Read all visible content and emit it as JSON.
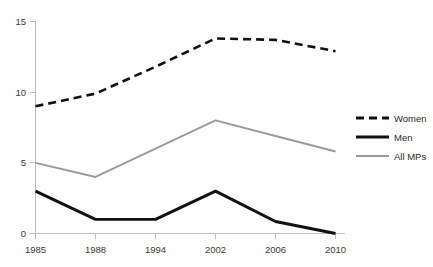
{
  "chart_data": {
    "type": "line",
    "title": "",
    "subtitle": "",
    "xlabel": "",
    "ylabel": "",
    "categories": [
      "1985",
      "1988",
      "1994",
      "2002",
      "2006",
      "2010"
    ],
    "x": [
      1985,
      1988,
      1994,
      2002,
      2006,
      2010
    ],
    "series": [
      {
        "name": "Women",
        "values": [
          9.0,
          9.9,
          11.8,
          13.8,
          13.7,
          12.9
        ],
        "style": "dashed",
        "color": "#111111"
      },
      {
        "name": "Men",
        "values": [
          3.0,
          1.0,
          1.0,
          3.0,
          0.85,
          0.0
        ],
        "style": "solid-thick",
        "color": "#111111"
      },
      {
        "name": "All MPs",
        "values": [
          5.0,
          4.0,
          6.0,
          8.0,
          6.9,
          5.8
        ],
        "style": "solid-thin",
        "color": "#9a9a9a"
      }
    ],
    "ylim": [
      0,
      15
    ],
    "yticks": [
      0,
      5,
      10,
      15
    ],
    "ytick_labels": [
      "0",
      "5",
      "10",
      "15"
    ],
    "xtick_labels": [
      "1985",
      "1988",
      "1994",
      "2002",
      "2006",
      "2010"
    ],
    "grid": false,
    "legend_position": "right",
    "legend_entries": [
      "Women",
      "Men",
      "All MPs"
    ],
    "annotations": []
  },
  "axes": {
    "y": {
      "ticks": [
        {
          "label": "15",
          "value": 15
        },
        {
          "label": "10",
          "value": 10
        },
        {
          "label": "5",
          "value": 5
        },
        {
          "label": "0",
          "value": 0
        }
      ]
    },
    "x": {
      "ticks": [
        {
          "label": "1985",
          "value": 1985
        },
        {
          "label": "1988",
          "value": 1988
        },
        {
          "label": "1994",
          "value": 1994
        },
        {
          "label": "2002",
          "value": 2002
        },
        {
          "label": "2006",
          "value": 2006
        },
        {
          "label": "2010",
          "value": 2010
        }
      ]
    }
  },
  "legend": {
    "items": [
      {
        "label": "Women"
      },
      {
        "label": "Men"
      },
      {
        "label": "All MPs"
      }
    ]
  },
  "colors": {
    "women": "#111111",
    "men": "#111111",
    "all_mps": "#9a9a9a",
    "axis": "#bdbdbd",
    "text": "#3a3a3a",
    "background": "#fefefe"
  }
}
